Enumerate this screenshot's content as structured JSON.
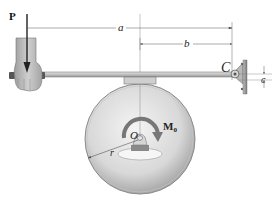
{
  "figure": {
    "labels": {
      "force": "P",
      "dim_a": "a",
      "dim_b": "b",
      "pivot": "C",
      "dim_c": "c",
      "center": "O",
      "radius": "r",
      "moment_main": "M",
      "moment_sub": "0"
    },
    "colors": {
      "disk_light": "#e6e6e6",
      "disk_dark": "#a8a8a8",
      "bar": "#c8c8c8",
      "bar_edge": "#6a6a6a",
      "wall": "#9a9a9a",
      "dimension_line": "#555555",
      "force_arrow": "#222222",
      "moment_arrow": "#777777"
    }
  }
}
